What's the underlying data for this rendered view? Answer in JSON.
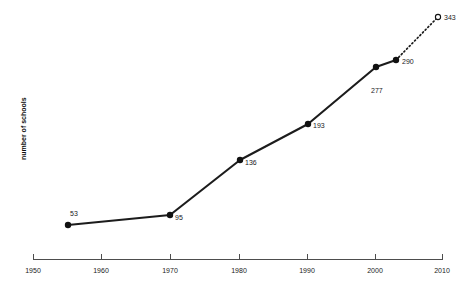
{
  "chart_data": {
    "type": "line",
    "title": "",
    "xlabel": "",
    "ylabel": "number of schools",
    "xlim": [
      1950,
      2010
    ],
    "ylim": [
      0,
      360
    ],
    "grid": false,
    "legend": "none",
    "x_ticks": [
      "1950",
      "1960",
      "1970",
      "1980",
      "1990",
      "2000",
      "2010"
    ],
    "x_tick_values": [
      1950,
      1960,
      1970,
      1980,
      1990,
      2000,
      2010
    ],
    "y_ticks": [],
    "series": [
      {
        "name": "number of schools",
        "x": [
          1955,
          1970,
          1980,
          1990,
          2000,
          2003,
          2009
        ],
        "values": [
          53,
          95,
          136,
          193,
          277,
          290,
          343
        ],
        "labels": [
          "53",
          "95",
          "136",
          "193",
          "277",
          "290",
          "343"
        ],
        "marker_styles": [
          "filled",
          "filled",
          "filled",
          "filled",
          "filled",
          "filled",
          "open"
        ],
        "segment_styles": [
          "solid",
          "solid",
          "solid",
          "solid",
          "solid",
          "dotted"
        ]
      }
    ],
    "points": [
      {
        "label": "53",
        "value": 53,
        "year": 1955,
        "px": 68,
        "py": 225,
        "marker": "filled",
        "label_dx": 2,
        "label_dy": -9
      },
      {
        "label": "95",
        "value": 95,
        "year": 1970,
        "px": 170,
        "py": 215,
        "marker": "filled",
        "label_dx": 5,
        "label_dy": 5
      },
      {
        "label": "136",
        "value": 136,
        "year": 1980,
        "px": 240,
        "py": 160,
        "marker": "filled",
        "label_dx": 5,
        "label_dy": 5
      },
      {
        "label": "193",
        "value": 193,
        "year": 1990,
        "px": 308,
        "py": 124,
        "marker": "filled",
        "label_dx": 5,
        "label_dy": 4
      },
      {
        "label": "277",
        "value": 277,
        "year": 2000,
        "px": 376,
        "py": 67,
        "marker": "filled",
        "label_dx": -5,
        "label_dy": 26
      },
      {
        "label": "290",
        "value": 290,
        "year": 2003,
        "px": 396,
        "py": 60,
        "marker": "filled",
        "label_dx": 6,
        "label_dy": 4
      },
      {
        "label": "343",
        "value": 343,
        "year": 2009,
        "px": 438,
        "py": 17,
        "marker": "open",
        "label_dx": 6,
        "label_dy": 3
      }
    ],
    "colors": {
      "line": "#1c1c1c",
      "marker": "#111111",
      "marker_open_fill": "#ffffff",
      "axis": "#4d4d4d",
      "text": "#1a1a1a",
      "background": "#ffffff"
    },
    "axis_geometry": {
      "x_start_px": 33,
      "x_end_px": 443,
      "baseline_py": 259,
      "tick_height_px": 5,
      "tick_positions_px": [
        33,
        101,
        170,
        239,
        307,
        375,
        443
      ]
    }
  }
}
